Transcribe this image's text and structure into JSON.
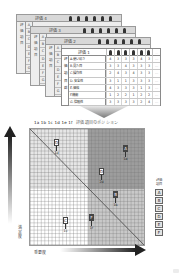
{
  "sheets": [
    {
      "title": "評価 4",
      "side": [
        "評",
        "価",
        "項",
        "目"
      ],
      "letters": [
        "A",
        "B",
        "C",
        "D",
        "E",
        "F",
        "G"
      ]
    },
    {
      "title": "評価 3",
      "side": [
        "評",
        "価",
        "項",
        "目"
      ],
      "letters": [
        "A",
        "B",
        "C",
        "D",
        "E",
        "F",
        "G"
      ]
    },
    {
      "title": "評価 2",
      "side": [
        "評",
        "価",
        "項",
        "目"
      ],
      "letters": [
        "A",
        "B",
        "C",
        "D",
        "E",
        "F",
        "G"
      ]
    }
  ],
  "front_sheet": {
    "title": "評価 1",
    "column_icons": [
      "person-icon",
      "person-icon",
      "person-icon",
      "person-icon",
      "person-icon",
      "person-icon"
    ],
    "extra_column": "…",
    "side": [
      "評",
      "価",
      "項",
      "目",
      "群"
    ],
    "rows": [
      {
        "label": "A.使い易さ",
        "values": [
          "4",
          "3",
          "3",
          "3",
          "4",
          "3"
        ],
        "extra": "…"
      },
      {
        "label": "B.見た目",
        "values": [
          "3",
          "3",
          "4",
          "3",
          "3",
          "3"
        ],
        "extra": "…"
      },
      {
        "label": "C.操作性",
        "values": [
          "2",
          "4",
          "3",
          "4",
          "3",
          "3"
        ],
        "extra": "…"
      },
      {
        "label": "D.安全性",
        "values": [
          "3",
          "1",
          "1",
          "3",
          "3",
          "3"
        ],
        "extra": "…"
      },
      {
        "label": "E.価格",
        "values": [
          "4",
          "3",
          "3",
          "3",
          "1",
          "3"
        ],
        "extra": "…"
      },
      {
        "label": "F.機能",
        "values": [
          "1",
          "2",
          "2",
          "1",
          "2",
          "2"
        ],
        "extra": "…"
      },
      {
        "label": "G.信頼性",
        "values": [
          "3",
          "3",
          "3",
          "3",
          "2",
          "4"
        ],
        "extra": "…"
      }
    ]
  },
  "matrix": {
    "title_codes": "1a 1b 1c 1d 1e 1f",
    "title_text": "評価項目のポジション",
    "y_axis_label": "満足度",
    "x_axis_label": "重要度",
    "quadrant_colors": {
      "top_left": "#e6e6e6",
      "top_right": "#9d9d9d",
      "bottom_left": "#ffffff",
      "bottom_right": "#c9c9c9"
    },
    "markers": [
      {
        "letter": "D",
        "code": "1d",
        "x": 27,
        "y": 10,
        "dark": false
      },
      {
        "letter": "A",
        "code": "1a",
        "x": 96,
        "y": 16,
        "dark": true
      },
      {
        "letter": "D",
        "code": "2d",
        "x": 72,
        "y": 39,
        "dark": false
      },
      {
        "letter": "B",
        "code": "1b",
        "x": 86,
        "y": 62,
        "dark": true
      },
      {
        "letter": "C",
        "code": "1c",
        "x": 36,
        "y": 88,
        "dark": false
      },
      {
        "letter": "F",
        "code": "1f",
        "x": 62,
        "y": 85,
        "dark": true
      }
    ]
  },
  "legend": {
    "caption": "評価項目",
    "items": [
      "A",
      "B",
      "C",
      "D",
      "E",
      "F"
    ]
  }
}
